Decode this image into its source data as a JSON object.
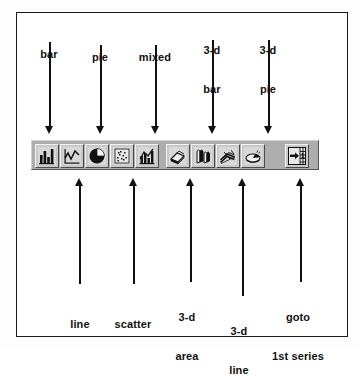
{
  "diagram": {
    "frame_border_color": "#1a1a1a",
    "toolbar_color": "#adadad",
    "button_face_color": "#c9c9c9"
  },
  "top_labels": [
    {
      "id": "bar",
      "text": "bar",
      "line1": "bar",
      "line2": ""
    },
    {
      "id": "pie",
      "text": "pie",
      "line1": "pie",
      "line2": ""
    },
    {
      "id": "mixed",
      "text": "mixed",
      "line1": "mixed",
      "line2": ""
    },
    {
      "id": "3d-bar",
      "text": "3-d bar",
      "line1": "3-d",
      "line2": "bar"
    },
    {
      "id": "3d-pie",
      "text": "3-d pie",
      "line1": "3-d",
      "line2": "pie"
    }
  ],
  "bottom_labels": [
    {
      "id": "line",
      "text": "line",
      "line1": "line",
      "line2": ""
    },
    {
      "id": "scatter",
      "text": "scatter",
      "line1": "scatter",
      "line2": ""
    },
    {
      "id": "3d-area",
      "text": "3-d area",
      "line1": "3-d",
      "line2": "area"
    },
    {
      "id": "3d-line",
      "text": "3-d line",
      "line1": "3-d",
      "line2": "line"
    },
    {
      "id": "goto-1st",
      "text": "goto 1st series",
      "line1": "goto",
      "line2": "1st series"
    }
  ],
  "toolbar": {
    "groups": [
      {
        "name": "2d-charts",
        "buttons": [
          {
            "id": "bar",
            "icon": "bar-chart-icon",
            "label": "bar"
          },
          {
            "id": "line",
            "icon": "line-chart-icon",
            "label": "line"
          },
          {
            "id": "pie",
            "icon": "pie-chart-icon",
            "label": "pie"
          },
          {
            "id": "scatter",
            "icon": "scatter-plot-icon",
            "label": "scatter"
          },
          {
            "id": "mixed",
            "icon": "mixed-chart-icon",
            "label": "mixed"
          }
        ]
      },
      {
        "name": "3d-charts",
        "buttons": [
          {
            "id": "3d-area",
            "icon": "3d-area-chart-icon",
            "label": "3-d area"
          },
          {
            "id": "3d-bar",
            "icon": "3d-bar-chart-icon",
            "label": "3-d bar"
          },
          {
            "id": "3d-line",
            "icon": "3d-line-chart-icon",
            "label": "3-d line"
          },
          {
            "id": "3d-pie",
            "icon": "3d-pie-chart-icon",
            "label": "3-d pie"
          }
        ]
      },
      {
        "name": "navigation",
        "buttons": [
          {
            "id": "goto-1st",
            "icon": "goto-first-series-icon",
            "label": "goto 1st series",
            "badge": "1"
          }
        ]
      }
    ]
  }
}
